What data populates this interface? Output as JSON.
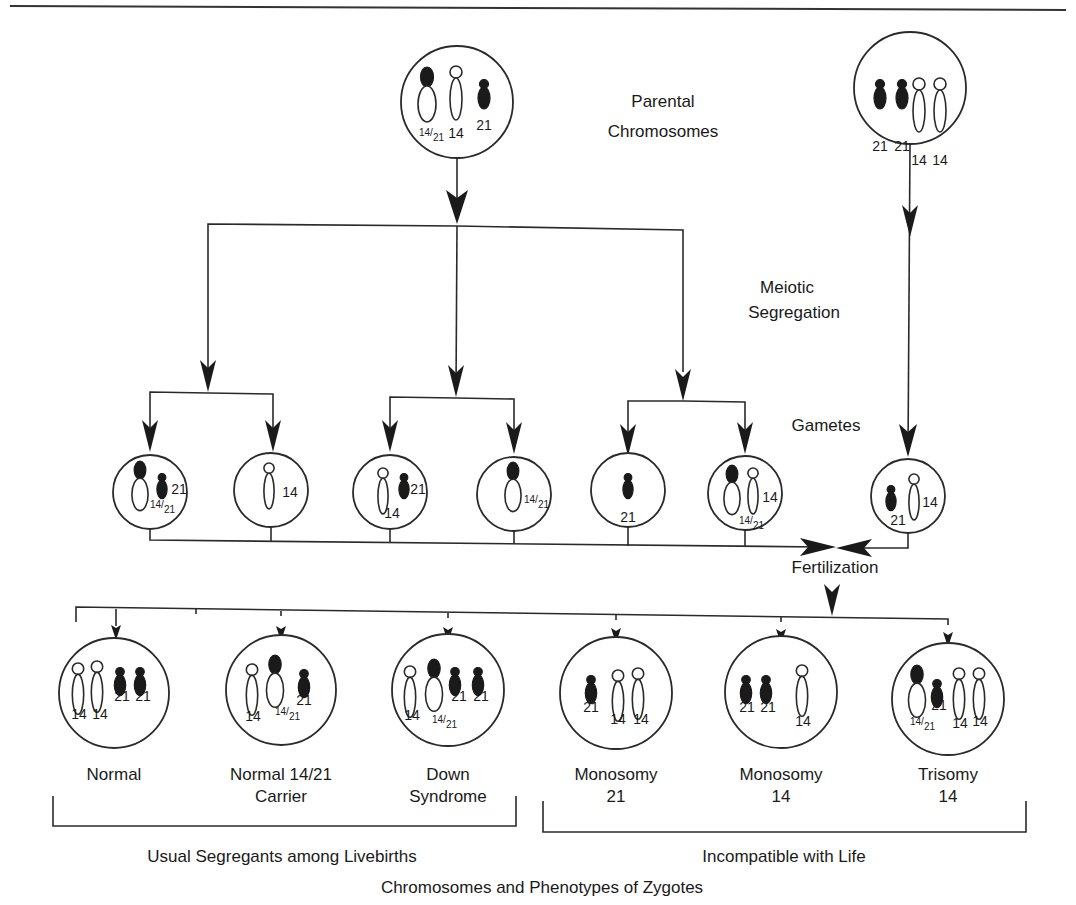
{
  "labels": {
    "parental": [
      "Parental",
      "Chromosomes"
    ],
    "meiotic": [
      "Meiotic",
      "Segregation"
    ],
    "gametes": "Gametes",
    "fertilization": "Fertilization",
    "livebirths_bracket": "Usual Segregants among Livebirths",
    "incompatible_bracket": "Incompatible with Life",
    "footer": "Chromosomes and Phenotypes of Zygotes"
  },
  "parents": [
    {
      "id": "carrier-parent",
      "cx": 457,
      "cy": 102,
      "r": 56,
      "chromosomes": [
        {
          "type": "translocation",
          "x": 427,
          "y": 68,
          "label": "14/21"
        },
        {
          "type": "14",
          "x": 456,
          "y": 66,
          "label": "14"
        },
        {
          "type": "21",
          "x": 484,
          "y": 80,
          "label": "21"
        }
      ]
    },
    {
      "id": "normal-parent",
      "cx": 910,
      "cy": 88,
      "r": 56,
      "chromosomes": [
        {
          "type": "21",
          "x": 880,
          "y": 80,
          "label": "21"
        },
        {
          "type": "21",
          "x": 902,
          "y": 80,
          "label": "21"
        },
        {
          "type": "14",
          "x": 919,
          "y": 78,
          "label": "14"
        },
        {
          "type": "14",
          "x": 940,
          "y": 78,
          "label": "14"
        }
      ]
    }
  ],
  "gametes": [
    {
      "cx": 150,
      "cy": 492,
      "r": 37,
      "chromosomes": [
        {
          "type": "translocation",
          "x": 140,
          "y": 462,
          "label": "14/21",
          "lx": 158,
          "ly": 512
        },
        {
          "type": "21",
          "x": 162,
          "y": 474,
          "label": "21",
          "lx": 179,
          "ly": 494
        }
      ]
    },
    {
      "cx": 271,
      "cy": 490,
      "r": 37,
      "chromosomes": [
        {
          "type": "14",
          "x": 269,
          "y": 463,
          "label": "14",
          "lx": 290,
          "ly": 497
        }
      ]
    },
    {
      "cx": 390,
      "cy": 492,
      "r": 37,
      "chromosomes": [
        {
          "type": "14",
          "x": 383,
          "y": 468,
          "label": "14",
          "lx": 392,
          "ly": 518
        },
        {
          "type": "21",
          "x": 404,
          "y": 474,
          "label": "21",
          "lx": 418,
          "ly": 494
        }
      ]
    },
    {
      "cx": 514,
      "cy": 494,
      "r": 37,
      "chromosomes": [
        {
          "type": "translocation",
          "x": 513,
          "y": 463,
          "label": "14/21",
          "lx": 532,
          "ly": 507
        }
      ]
    },
    {
      "cx": 628,
      "cy": 490,
      "r": 37,
      "chromosomes": [
        {
          "type": "21",
          "x": 628,
          "y": 474,
          "label": "21",
          "lx": 628,
          "ly": 522
        }
      ]
    },
    {
      "cx": 745,
      "cy": 493,
      "r": 37,
      "chromosomes": [
        {
          "type": "translocation",
          "x": 732,
          "y": 466,
          "label": "14/21",
          "lx": 747,
          "ly": 528
        },
        {
          "type": "14",
          "x": 753,
          "y": 468,
          "label": "14",
          "lx": 770,
          "ly": 502
        }
      ]
    },
    {
      "cx": 908,
      "cy": 496,
      "r": 37,
      "chromosomes": [
        {
          "type": "21",
          "x": 891,
          "y": 486,
          "label": "21",
          "lx": 898,
          "ly": 525
        },
        {
          "type": "14",
          "x": 914,
          "y": 474,
          "label": "14",
          "lx": 930,
          "ly": 507
        }
      ]
    }
  ],
  "zygotes": [
    {
      "name": "Normal",
      "cx": 114,
      "cy": 693,
      "r": 55,
      "phenotype": [
        "Normal"
      ],
      "chromosomes": [
        {
          "type": "14",
          "x": 78,
          "y": 663,
          "label": "14",
          "lx": 79,
          "ly": 719
        },
        {
          "type": "14",
          "x": 97,
          "y": 661,
          "label": "14",
          "lx": 100,
          "ly": 719
        },
        {
          "type": "21",
          "x": 120,
          "y": 668,
          "label": "21",
          "lx": 122,
          "ly": 701
        },
        {
          "type": "21",
          "x": 140,
          "y": 668,
          "label": "21",
          "lx": 143,
          "ly": 701
        }
      ]
    },
    {
      "name": "Normal 14/21 Carrier",
      "cx": 281,
      "cy": 690,
      "r": 55,
      "phenotype": [
        "Normal  14/21",
        "Carrier"
      ],
      "chromosomes": [
        {
          "type": "14",
          "x": 252,
          "y": 664,
          "label": "14",
          "lx": 253,
          "ly": 721
        },
        {
          "type": "translocation",
          "x": 275,
          "y": 656,
          "label": "14/21",
          "lx": 283,
          "ly": 719
        },
        {
          "type": "21",
          "x": 304,
          "y": 670,
          "label": "21",
          "lx": 304,
          "ly": 705
        }
      ]
    },
    {
      "name": "Down Syndrome",
      "cx": 448,
      "cy": 690,
      "r": 56,
      "phenotype": [
        "Down",
        "Syndrome"
      ],
      "chromosomes": [
        {
          "type": "14",
          "x": 410,
          "y": 666,
          "label": "14",
          "lx": 412,
          "ly": 720
        },
        {
          "type": "translocation",
          "x": 434,
          "y": 660,
          "label": "14/21",
          "lx": 440,
          "ly": 727
        },
        {
          "type": "21",
          "x": 455,
          "y": 668,
          "label": "21",
          "lx": 459,
          "ly": 701
        },
        {
          "type": "21",
          "x": 478,
          "y": 668,
          "label": "21",
          "lx": 481,
          "ly": 701
        }
      ]
    },
    {
      "name": "Monosomy 21",
      "cx": 616,
      "cy": 693,
      "r": 56,
      "phenotype": [
        "Monosomy",
        "21"
      ],
      "chromosomes": [
        {
          "type": "21",
          "x": 591,
          "y": 676,
          "label": "21",
          "lx": 591,
          "ly": 712
        },
        {
          "type": "14",
          "x": 618,
          "y": 670,
          "label": "14",
          "lx": 618,
          "ly": 724
        },
        {
          "type": "14",
          "x": 638,
          "y": 668,
          "label": "14",
          "lx": 641,
          "ly": 724
        }
      ]
    },
    {
      "name": "Monosomy 14",
      "cx": 781,
      "cy": 692,
      "r": 56,
      "phenotype": [
        "Monosomy",
        "14"
      ],
      "chromosomes": [
        {
          "type": "21",
          "x": 746,
          "y": 676,
          "label": "21",
          "lx": 747,
          "ly": 712
        },
        {
          "type": "21",
          "x": 766,
          "y": 676,
          "label": "21",
          "lx": 768,
          "ly": 712
        },
        {
          "type": "14",
          "x": 802,
          "y": 665,
          "label": "14",
          "lx": 803,
          "ly": 726
        }
      ]
    },
    {
      "name": "Trisomy 14",
      "cx": 948,
      "cy": 699,
      "r": 56,
      "phenotype": [
        "Trisomy",
        "14"
      ],
      "chromosomes": [
        {
          "type": "translocation",
          "x": 917,
          "y": 666,
          "label": "14/21",
          "lx": 918,
          "ly": 729
        },
        {
          "type": "21",
          "x": 937,
          "y": 680,
          "label": "21",
          "lx": 939,
          "ly": 710
        },
        {
          "type": "14",
          "x": 959,
          "y": 668,
          "label": "14",
          "lx": 960,
          "ly": 728
        },
        {
          "type": "14",
          "x": 979,
          "y": 668,
          "label": "14",
          "lx": 980,
          "ly": 726
        }
      ]
    }
  ]
}
